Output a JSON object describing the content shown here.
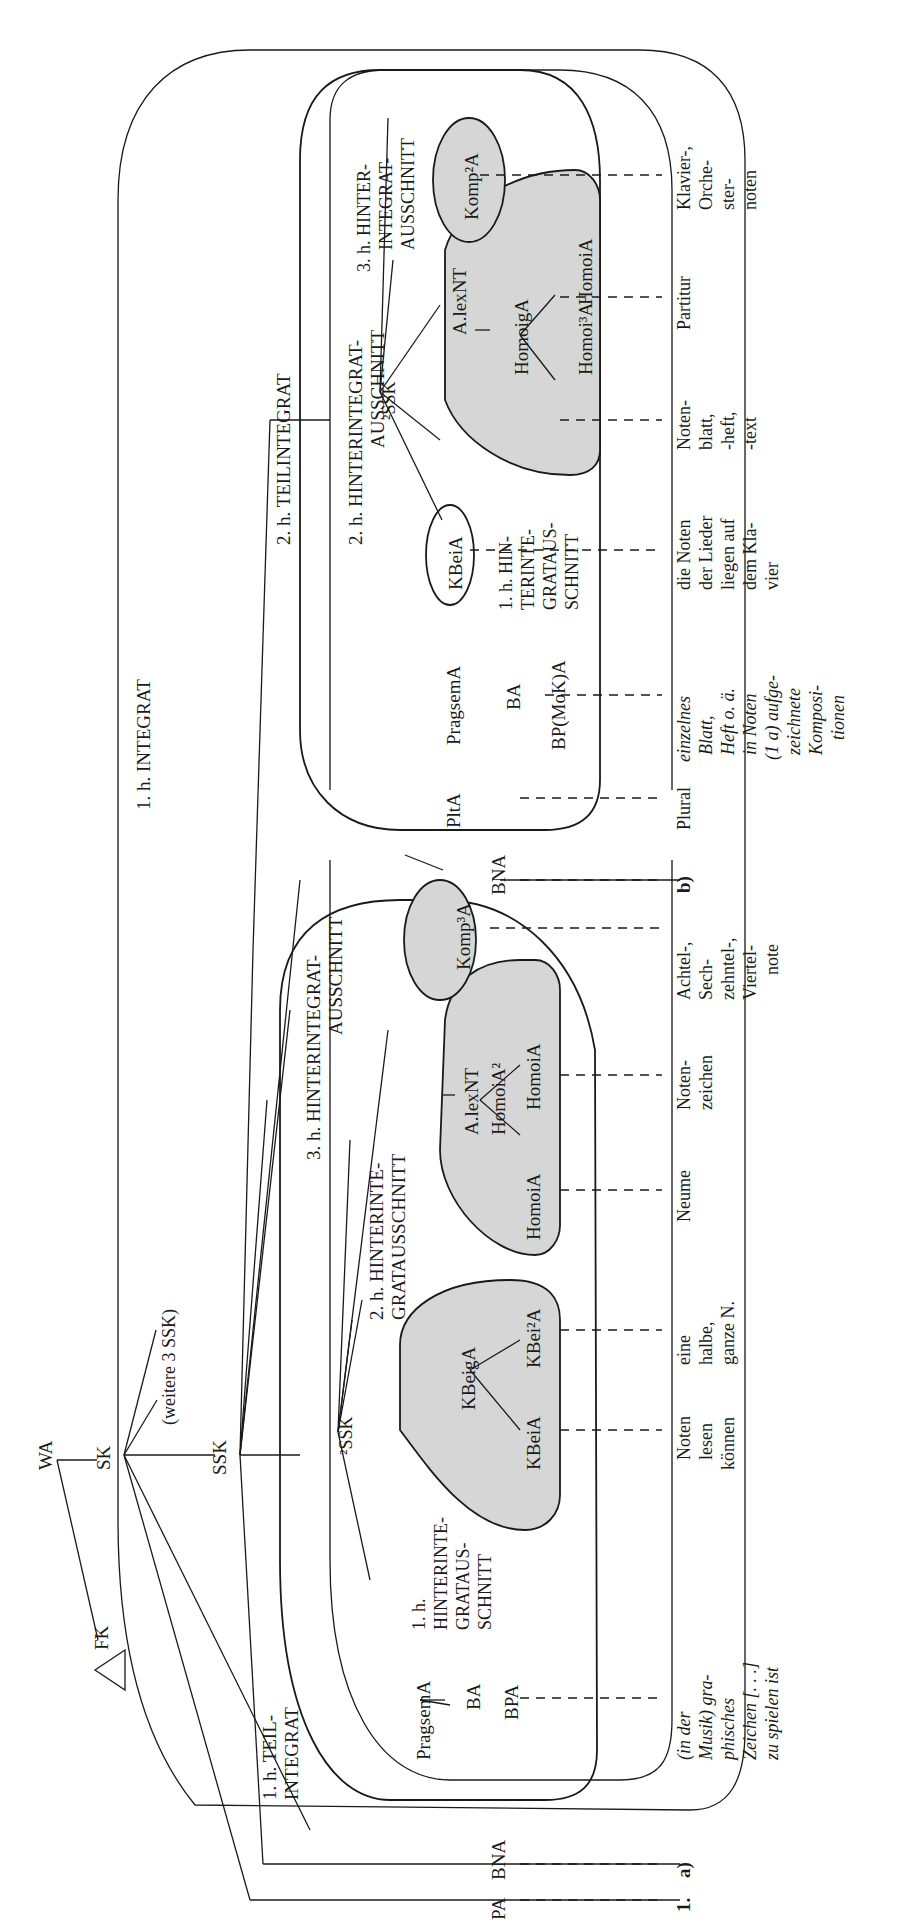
{
  "diagram": {
    "orientation": "rotated-90-ccw",
    "root": {
      "wa": "WA",
      "fk": "FK",
      "sk": "SK",
      "ssk": "SSK",
      "more_ssk": "(weitere 3 SSK)",
      "pa": "PA",
      "bna_a": "BNA",
      "bna_b": "BNA"
    },
    "frames": {
      "integrat_1": "1. h. INTEGRAT",
      "teilintegrat_1": [
        "1. h. TEIL-",
        "INTEGRAT"
      ],
      "teilintegrat_2": "2. h. TEILINTEGRAT",
      "hinterintegrat_3_a": [
        "3. h. HINTERINTEGRAT-",
        "AUSSCHNITT"
      ]
    },
    "section_a": {
      "marker": "a)",
      "ssk2": "²SSK",
      "pragsem": "PragsemA",
      "ba": "BA",
      "bpa": "BPA",
      "hia_1": [
        "1. h.",
        "HINTERINTE-",
        "GRATAUS-",
        "SCHNITT"
      ],
      "hia_2": [
        "2. h. HINTERINTE-",
        "GRATAUSSCHNITT"
      ],
      "group1": {
        "top": "KBeigA",
        "left": "KBeiA",
        "right": "KBei²A"
      },
      "group2": {
        "top": "A.lexNT",
        "mid": "HomoiA²",
        "left": "HomoiA",
        "right": "HomoiA"
      },
      "komp": "Komp³A",
      "glosses": {
        "pa": "1.",
        "bpa": [
          "(in der",
          "Musik) gra-",
          "phisches",
          "Zeichen [. . .]",
          "zu spielen ist"
        ],
        "kbeia": [
          "Noten",
          "lesen",
          "können"
        ],
        "kbei2a": [
          "eine",
          "halbe,",
          "ganze N."
        ],
        "homoia_l": [
          "Neume"
        ],
        "homoia_r": [
          "Noten-",
          "zeichen"
        ],
        "komp3a": [
          "Achtel-,",
          "Sech-",
          "zehntel-,",
          "Viertel-",
          "note"
        ]
      }
    },
    "section_b": {
      "marker": "b)",
      "ssk2": "²SSK",
      "plta": "PltA",
      "pragsem": "PragsemA",
      "ba": "BA",
      "bpmoka": "BP(MoK)A",
      "kbeia": "KBeiA",
      "hia_1": [
        "1. h. HIN-",
        "TERINTE-",
        "GRATAUS-",
        "SCHNITT"
      ],
      "hia_2": [
        "2. h. HINTERINTEGRAT-",
        "AUSSCHNITT"
      ],
      "hia_3": [
        "3. h. HINTER-",
        "INTEGRAT-",
        "AUSSCHNITT"
      ],
      "group": {
        "top": "A.lexNT",
        "mid": "HomoigA",
        "left": "Homoi³A",
        "right": "HomoiA"
      },
      "komp": "Komp²A",
      "glosses": {
        "plta": [
          "Plural"
        ],
        "bpmoka": [
          "einzelnes",
          "Blatt,",
          "Heft o. ä.",
          "in Noten",
          "(1 a) aufge-",
          "zeichnete",
          "Komposi-",
          "tionen"
        ],
        "kbeia": [
          "die Noten",
          "der Lieder",
          "liegen auf",
          "dem Kla-",
          "vier"
        ],
        "homoi3a": [
          "Noten-",
          "blatt,",
          "-heft,",
          "-text"
        ],
        "homoia": [
          "Partitur"
        ],
        "komp2a": [
          "Klavier-,",
          "Orche-",
          "ster-",
          "noten"
        ]
      }
    }
  }
}
